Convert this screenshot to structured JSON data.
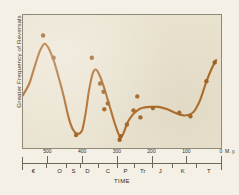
{
  "chart_data": {
    "type": "line",
    "title": "",
    "xlabel": "TIME",
    "ylabel": "Greater Frequency of Reversals",
    "xlim": [
      570,
      0
    ],
    "ylim": [
      0,
      1
    ],
    "grid": false,
    "legend": null,
    "x_numeric_ticks": [
      {
        "value": 500,
        "label": "500"
      },
      {
        "value": 400,
        "label": "400"
      },
      {
        "value": 300,
        "label": "300"
      },
      {
        "value": 200,
        "label": "200"
      },
      {
        "value": 100,
        "label": "100"
      },
      {
        "value": 0,
        "label": "0"
      }
    ],
    "x_unit_label": "M. y.",
    "period_ticks": [
      {
        "label": "€",
        "value": 540
      },
      {
        "label": "O",
        "value": 465
      },
      {
        "label": "S",
        "value": 425
      },
      {
        "label": "D",
        "value": 385
      },
      {
        "label": "C",
        "value": 326
      },
      {
        "label": "P",
        "value": 275
      },
      {
        "label": "Tr",
        "value": 225
      },
      {
        "label": "J",
        "value": 175
      },
      {
        "label": "K",
        "value": 110
      },
      {
        "label": "T",
        "value": 35
      }
    ],
    "series": [
      {
        "name": "Reversal frequency (smoothed curve)",
        "color": "#a8601a",
        "points": [
          {
            "x": 570,
            "y": 0.4
          },
          {
            "x": 552,
            "y": 0.5
          },
          {
            "x": 535,
            "y": 0.66
          },
          {
            "x": 521,
            "y": 0.78
          },
          {
            "x": 508,
            "y": 0.84
          },
          {
            "x": 496,
            "y": 0.8
          },
          {
            "x": 482,
            "y": 0.7
          },
          {
            "x": 468,
            "y": 0.56
          },
          {
            "x": 452,
            "y": 0.38
          },
          {
            "x": 438,
            "y": 0.2
          },
          {
            "x": 425,
            "y": 0.1
          },
          {
            "x": 412,
            "y": 0.07
          },
          {
            "x": 400,
            "y": 0.1
          },
          {
            "x": 390,
            "y": 0.24
          },
          {
            "x": 380,
            "y": 0.44
          },
          {
            "x": 370,
            "y": 0.58
          },
          {
            "x": 360,
            "y": 0.62
          },
          {
            "x": 348,
            "y": 0.56
          },
          {
            "x": 334,
            "y": 0.44
          },
          {
            "x": 320,
            "y": 0.3
          },
          {
            "x": 306,
            "y": 0.16
          },
          {
            "x": 295,
            "y": 0.07
          },
          {
            "x": 288,
            "y": 0.04
          },
          {
            "x": 280,
            "y": 0.08
          },
          {
            "x": 270,
            "y": 0.16
          },
          {
            "x": 258,
            "y": 0.22
          },
          {
            "x": 245,
            "y": 0.26
          },
          {
            "x": 228,
            "y": 0.29
          },
          {
            "x": 205,
            "y": 0.3
          },
          {
            "x": 180,
            "y": 0.3
          },
          {
            "x": 155,
            "y": 0.28
          },
          {
            "x": 132,
            "y": 0.25
          },
          {
            "x": 112,
            "y": 0.23
          },
          {
            "x": 95,
            "y": 0.23
          },
          {
            "x": 78,
            "y": 0.26
          },
          {
            "x": 60,
            "y": 0.36
          },
          {
            "x": 44,
            "y": 0.5
          },
          {
            "x": 28,
            "y": 0.62
          },
          {
            "x": 14,
            "y": 0.7
          }
        ]
      }
    ],
    "scatter_points": [
      {
        "x": 512,
        "y": 0.91
      },
      {
        "x": 482,
        "y": 0.72
      },
      {
        "x": 372,
        "y": 0.72
      },
      {
        "x": 348,
        "y": 0.5
      },
      {
        "x": 338,
        "y": 0.43
      },
      {
        "x": 326,
        "y": 0.33
      },
      {
        "x": 336,
        "y": 0.28
      },
      {
        "x": 417,
        "y": 0.06
      },
      {
        "x": 292,
        "y": 0.02
      },
      {
        "x": 289,
        "y": 0.05
      },
      {
        "x": 271,
        "y": 0.15
      },
      {
        "x": 252,
        "y": 0.27
      },
      {
        "x": 241,
        "y": 0.39
      },
      {
        "x": 232,
        "y": 0.21
      },
      {
        "x": 196,
        "y": 0.29
      },
      {
        "x": 120,
        "y": 0.25
      },
      {
        "x": 88,
        "y": 0.22
      },
      {
        "x": 42,
        "y": 0.52
      },
      {
        "x": 18,
        "y": 0.68
      }
    ]
  }
}
